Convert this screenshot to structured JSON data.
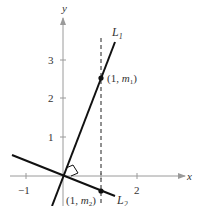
{
  "figure": {
    "axes": {
      "x_label": "x",
      "y_label": "y",
      "x_ticks": [
        "−1",
        "2"
      ],
      "y_ticks": [
        "1",
        "2",
        "3"
      ],
      "axis_color": "#9a9a9a"
    },
    "lines": [
      {
        "name": "L",
        "sub": "1",
        "description": "Line L1 with slope m1 through origin"
      },
      {
        "name": "L",
        "sub": "2",
        "description": "Line L2 with slope m2 through origin, perpendicular to L1"
      }
    ],
    "points": [
      {
        "label_pre": "(1, ",
        "var": "m",
        "sub": "1",
        "label_post": ")"
      },
      {
        "label_pre": "(1, ",
        "var": "m",
        "sub": "2",
        "label_post": ")"
      }
    ],
    "dashed_line": "x = 1",
    "right_angle_marker": true,
    "line_color": "#111111"
  }
}
